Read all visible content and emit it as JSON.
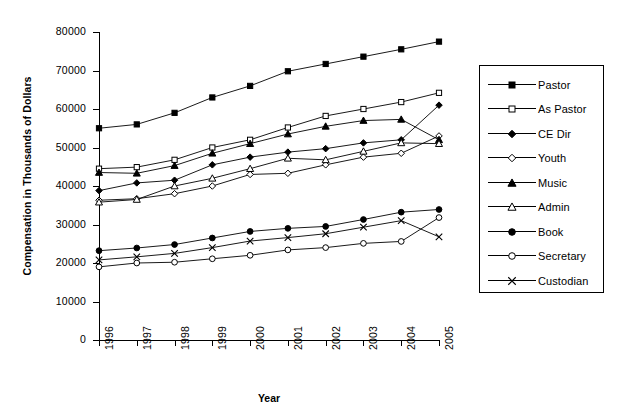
{
  "chart_data": {
    "type": "line",
    "title": "",
    "xlabel": "Year",
    "ylabel": "Compensation in Thousands of Dollars",
    "categories": [
      "1996",
      "1997",
      "1998",
      "1999",
      "2000",
      "2001",
      "2002",
      "2003",
      "2004",
      "2005"
    ],
    "x": [
      1996,
      1997,
      1998,
      1999,
      2000,
      2001,
      2002,
      2003,
      2004,
      2005
    ],
    "ylim": [
      0,
      80000
    ],
    "yticks": [
      0,
      10000,
      20000,
      30000,
      40000,
      50000,
      60000,
      70000,
      80000
    ],
    "ytick_labels": [
      "0",
      "10000",
      "20000",
      "30000",
      "40000",
      "50000",
      "60000",
      "70000",
      "80000"
    ],
    "grid": false,
    "legend_position": "right",
    "series": [
      {
        "name": "Pastor",
        "marker": "filled-square",
        "values": [
          55000,
          56000,
          59000,
          63000,
          66000,
          69800,
          71700,
          73600,
          75500,
          77500
        ]
      },
      {
        "name": "As Pastor",
        "marker": "open-square",
        "values": [
          44500,
          44900,
          46800,
          50000,
          52000,
          55200,
          58200,
          60000,
          61800,
          64200
        ]
      },
      {
        "name": "CE Dir",
        "marker": "filled-diamond",
        "values": [
          38800,
          40800,
          41500,
          45500,
          47500,
          48800,
          49700,
          51200,
          52000,
          61000
        ]
      },
      {
        "name": "Youth",
        "marker": "open-diamond",
        "values": [
          36300,
          36700,
          38000,
          40000,
          43000,
          43300,
          45500,
          47500,
          48500,
          53000
        ]
      },
      {
        "name": "Music",
        "marker": "filled-triangle",
        "values": [
          43500,
          43300,
          45300,
          48500,
          51000,
          53500,
          55500,
          57000,
          57300,
          52000
        ]
      },
      {
        "name": "Admin",
        "marker": "open-triangle",
        "values": [
          35800,
          36500,
          40000,
          42000,
          44500,
          47200,
          46800,
          49000,
          51200,
          51000
        ]
      },
      {
        "name": "Book",
        "marker": "filled-circle",
        "values": [
          23200,
          23900,
          24800,
          26500,
          28200,
          29000,
          29500,
          31300,
          33200,
          33900
        ]
      },
      {
        "name": "Secretary",
        "marker": "open-circle",
        "values": [
          19000,
          20000,
          20200,
          21100,
          22000,
          23400,
          24000,
          25100,
          25600,
          31800
        ]
      },
      {
        "name": "Custodian",
        "marker": "cross",
        "values": [
          20800,
          21600,
          22500,
          24000,
          25700,
          26600,
          27600,
          29300,
          31000,
          26800
        ]
      }
    ]
  },
  "legend": {
    "items": [
      {
        "label": "Pastor"
      },
      {
        "label": "As Pastor"
      },
      {
        "label": "CE Dir"
      },
      {
        "label": "Youth"
      },
      {
        "label": "Music"
      },
      {
        "label": "Admin"
      },
      {
        "label": "Book"
      },
      {
        "label": "Secretary"
      },
      {
        "label": "Custodian"
      }
    ]
  },
  "colors": {
    "line": "#000000",
    "background": "#ffffff",
    "axis": "#000000"
  }
}
